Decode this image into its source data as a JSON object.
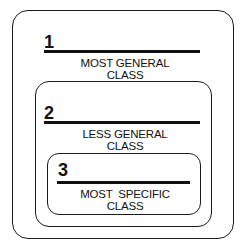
{
  "diagram": {
    "levels": [
      {
        "number": "1",
        "line1": "MOST GENERAL",
        "line2": "CLASS"
      },
      {
        "number": "2",
        "line1": "LESS GENERAL",
        "line2": "CLASS"
      },
      {
        "number": "3",
        "line1": "MOST  SPECIFIC",
        "line2": "CLASS"
      }
    ]
  }
}
